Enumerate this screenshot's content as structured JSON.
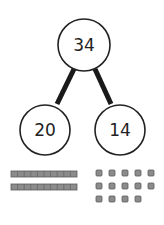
{
  "part_whole_model": {
    "whole": "34",
    "parts": [
      "20",
      "14"
    ]
  },
  "base_ten_blocks": {
    "tens_rods": 2,
    "units_per_rod": 10,
    "ones_cubes": 14,
    "ones_rows": [
      5,
      5,
      4
    ]
  },
  "colors": {
    "stroke": "#222222",
    "block_fill": "#8c8c8c",
    "block_edge": "#5a5a5a"
  }
}
